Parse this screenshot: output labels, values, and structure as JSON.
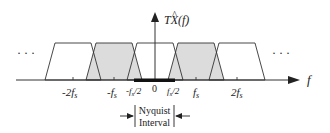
{
  "diagram": {
    "y_axis_label": "TX(f)",
    "y_axis_hat": "^",
    "x_axis_label": "f",
    "ellipsis_left": "· · ·",
    "ellipsis_right": "· · ·",
    "ticks": [
      {
        "label": "-2f",
        "sub": "s",
        "x": 73
      },
      {
        "label": "-f",
        "sub": "s",
        "x": 114
      },
      {
        "label": "-f",
        "sub": "s",
        "suffix": "/2",
        "x": 134
      },
      {
        "label": "0",
        "sub": "",
        "x": 155
      },
      {
        "label": "f",
        "sub": "s",
        "suffix": "/2",
        "x": 175
      },
      {
        "label": "f",
        "sub": "s",
        "x": 196
      },
      {
        "label": "2f",
        "sub": "s",
        "x": 237
      }
    ],
    "spectral_copies": [
      {
        "center": "-2fs",
        "shaded": false
      },
      {
        "center": "-fs",
        "shaded": true
      },
      {
        "center": "0",
        "shaded": false
      },
      {
        "center": "fs",
        "shaded": true
      },
      {
        "center": "2fs",
        "shaded": false
      }
    ],
    "nyquist": {
      "line1": "Nyquist",
      "line2": "Interval"
    },
    "colors": {
      "line": "#333333",
      "shade": "#dcdcdc",
      "bar": "#111111"
    }
  }
}
